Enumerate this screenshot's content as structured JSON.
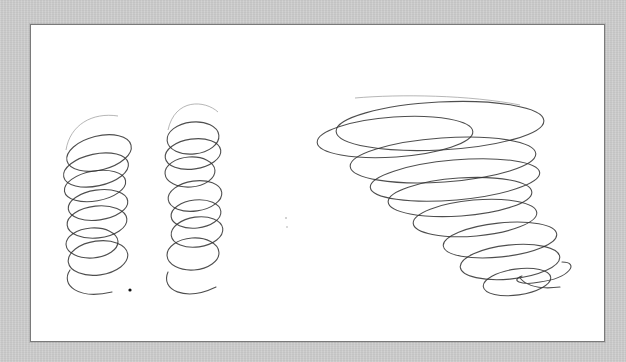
{
  "scene": {
    "description": "Scanned pencil sketch of three helical spirals on a white card with gray matte border",
    "colors": {
      "matte": "#cdcdcd",
      "card": "#ffffff",
      "card_border": "#7a7a7a",
      "pencil": "#2f2f2f"
    },
    "figures": [
      {
        "name": "left-helix",
        "type": "cylindrical-spiral",
        "coils": 7
      },
      {
        "name": "middle-helix",
        "type": "cylindrical-spiral",
        "coils": 8
      },
      {
        "name": "tornado-spiral",
        "type": "conical-spiral",
        "coils": 10
      }
    ]
  }
}
